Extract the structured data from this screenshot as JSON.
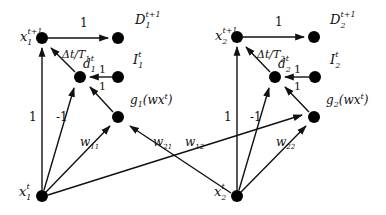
{
  "diagram": {
    "type": "neural-network-graph",
    "nodes": [
      {
        "id": "x1_next",
        "label": "x",
        "sub": "1",
        "sup": "t+1",
        "x": 42,
        "y": 38
      },
      {
        "id": "D1",
        "label": "D",
        "sub": "1",
        "sup": "t+1",
        "x": 118,
        "y": 38
      },
      {
        "id": "d1",
        "label": "d",
        "sub": "1",
        "sup": "t",
        "x": 80,
        "y": 77
      },
      {
        "id": "I1",
        "label": "I",
        "sub": "1",
        "sup": "t",
        "x": 118,
        "y": 77
      },
      {
        "id": "g1",
        "label": "g₁(wxᵗ)",
        "x": 118,
        "y": 117
      },
      {
        "id": "x1",
        "label": "x",
        "sub": "1",
        "sup": "t",
        "x": 42,
        "y": 196
      },
      {
        "id": "x2_next",
        "label": "x",
        "sub": "2",
        "sup": "t+1",
        "x": 237,
        "y": 38
      },
      {
        "id": "D2",
        "label": "D",
        "sub": "2",
        "sup": "t+1",
        "x": 314,
        "y": 38
      },
      {
        "id": "d2",
        "label": "d",
        "sub": "2",
        "sup": "t",
        "x": 275,
        "y": 77
      },
      {
        "id": "I2",
        "label": "I",
        "sub": "2",
        "sup": "t",
        "x": 315,
        "y": 77
      },
      {
        "id": "g2",
        "label": "g₂(wxᵗ)",
        "x": 314,
        "y": 117
      },
      {
        "id": "x2",
        "label": "x",
        "sub": "2",
        "sup": "t",
        "x": 237,
        "y": 196
      }
    ],
    "edges": [
      {
        "from": "x1_next",
        "to": "D1",
        "weight": "1"
      },
      {
        "from": "d1",
        "to": "x1_next",
        "weight": "Δt/T₁"
      },
      {
        "from": "I1",
        "to": "d1",
        "weight": "1"
      },
      {
        "from": "g1",
        "to": "d1",
        "weight": "1"
      },
      {
        "from": "x1",
        "to": "x1_next",
        "weight": "1"
      },
      {
        "from": "x1",
        "to": "d1",
        "weight": "-1"
      },
      {
        "from": "x1",
        "to": "g1",
        "weight": "w₁₁"
      },
      {
        "from": "x2",
        "to": "g1",
        "weight": "w₂₁"
      },
      {
        "from": "x1",
        "to": "g2",
        "weight": "w₁₂"
      },
      {
        "from": "x2_next",
        "to": "D2",
        "weight": "1"
      },
      {
        "from": "d2",
        "to": "x2_next",
        "weight": "Δt/T₂"
      },
      {
        "from": "I2",
        "to": "d2",
        "weight": "1"
      },
      {
        "from": "g2",
        "to": "d2",
        "weight": "1"
      },
      {
        "from": "x2",
        "to": "x2_next",
        "weight": "1"
      },
      {
        "from": "x2",
        "to": "d2",
        "weight": "-1"
      },
      {
        "from": "x2",
        "to": "g2",
        "weight": "w₂₂"
      }
    ]
  },
  "labels": {
    "x1_next": {
      "base": "x",
      "sub": "1",
      "sup": "t+1"
    },
    "D1": {
      "base": "D",
      "sub": "1",
      "sup": "t+1"
    },
    "d1": {
      "base": "d",
      "sub": "1",
      "sup": "t"
    },
    "I1": {
      "base": "I",
      "sub": "1",
      "sup": "t"
    },
    "g1": {
      "text": "g",
      "sub": "1",
      "arg": "(wx",
      "argsup": "t",
      "close": ")"
    },
    "x1": {
      "base": "x",
      "sub": "1",
      "sup": "t"
    },
    "x2_next": {
      "base": "x",
      "sub": "2",
      "sup": "t+1"
    },
    "D2": {
      "base": "D",
      "sub": "2",
      "sup": "t+1"
    },
    "d2": {
      "base": "d",
      "sub": "2",
      "sup": "t"
    },
    "I2": {
      "base": "I",
      "sub": "2",
      "sup": "t"
    },
    "g2": {
      "text": "g",
      "sub": "2",
      "arg": "(wx",
      "argsup": "t",
      "close": ")"
    },
    "x2": {
      "base": "x",
      "sub": "2",
      "sup": "t"
    }
  },
  "weights": {
    "x1n_D1": "1",
    "d1_x1n": "Δt/T",
    "d1_x1n_sub": "1",
    "I1_d1": "1",
    "g1_d1": "1",
    "x1_x1n": "1",
    "x1_d1": "-1",
    "w11": "w",
    "w11_sub": "11",
    "w21": "w",
    "w21_sub": "21",
    "w12": "w",
    "w12_sub": "12",
    "x2n_D2": "1",
    "d2_x2n": "Δt/T",
    "d2_x2n_sub": "2",
    "I2_d2": "1",
    "g2_d2": "1",
    "x2_x2n": "1",
    "x2_d2": "-1",
    "w22": "w",
    "w22_sub": "22"
  }
}
